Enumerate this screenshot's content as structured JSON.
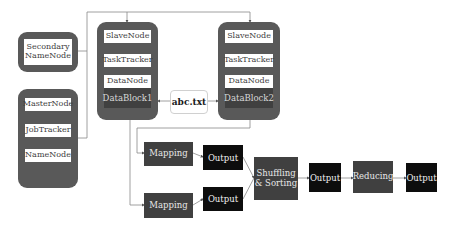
{
  "diagram": {
    "secondary_namenode": {
      "label": "Secondary NameNode",
      "line1": "Secondary",
      "line2": "NameNode"
    },
    "master": {
      "items": [
        {
          "label": "MasterNode"
        },
        {
          "label": "JobTracker"
        },
        {
          "label": "NameNode"
        }
      ]
    },
    "slaves": [
      {
        "items": [
          {
            "label": "SlaveNode"
          },
          {
            "label": "TaskTracker"
          },
          {
            "label": "DataNode"
          }
        ],
        "block": "DataBlock1"
      },
      {
        "items": [
          {
            "label": "SlaveNode"
          },
          {
            "label": "TaskTracker"
          },
          {
            "label": "DataNode"
          }
        ],
        "block": "DataBlock2"
      }
    ],
    "file": {
      "label": "abc.txt"
    },
    "pipeline": {
      "mapping1": "Mapping",
      "mapping2": "Mapping",
      "output1": "Output",
      "output2": "Output",
      "shuffle_line1": "Shuffling",
      "shuffle_line2": "& Sorting",
      "output3": "Output",
      "reducing": "Reducing",
      "output4": "Output"
    },
    "colors": {
      "group_bg": "#595959",
      "band_bg": "#404040",
      "process_bg": "#404040",
      "output_bg": "#0d0d0d",
      "line": "#7f7f7f"
    }
  }
}
